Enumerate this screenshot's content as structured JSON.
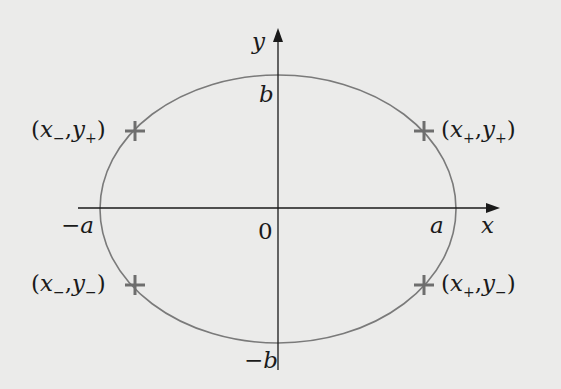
{
  "diagram": {
    "type": "ellipse-on-axes",
    "colors": {
      "background": "#ebebea",
      "axes": "#1a1a1a",
      "ellipse": "#7a7a7a",
      "markers": "#6e6e6e",
      "text": "#1a1a1a"
    },
    "axes": {
      "x_label": "x",
      "y_label": "y",
      "origin_label": "0"
    },
    "ellipse": {
      "semi_major_label_pos": "a",
      "semi_major_label_neg": "−a",
      "semi_minor_label_pos": "b",
      "semi_minor_label_neg": "−b"
    },
    "points": [
      {
        "id": "top-left",
        "x_sym": "x",
        "x_sub": "−",
        "y_sym": "y",
        "y_sub": "+"
      },
      {
        "id": "top-right",
        "x_sym": "x",
        "x_sub": "+",
        "y_sym": "y",
        "y_sub": "+"
      },
      {
        "id": "bottom-left",
        "x_sym": "x",
        "x_sub": "−",
        "y_sym": "y",
        "y_sub": "−"
      },
      {
        "id": "bottom-right",
        "x_sym": "x",
        "x_sub": "+",
        "y_sym": "y",
        "y_sub": "−"
      }
    ],
    "punct": {
      "open": "(",
      "comma": ",",
      "close": ")"
    }
  }
}
